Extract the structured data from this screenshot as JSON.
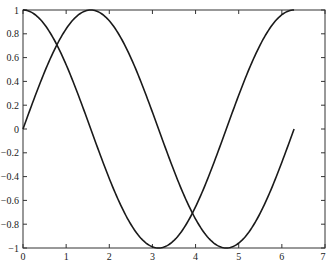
{
  "chart_data": {
    "type": "line",
    "title": "",
    "xlabel": "",
    "ylabel": "",
    "xlim": [
      0,
      7
    ],
    "ylim": [
      -1,
      1
    ],
    "grid": false,
    "legend": null,
    "x_ticks": [
      "0",
      "1",
      "2",
      "3",
      "4",
      "5",
      "6",
      "7"
    ],
    "y_ticks": [
      "-1",
      "-0.8",
      "-0.6",
      "-0.4",
      "-0.2",
      "0",
      "0.2",
      "0.4",
      "0.6",
      "0.8",
      "1"
    ],
    "series": [
      {
        "name": "sin(x)",
        "color": "#1a1a1a",
        "x": [
          0,
          0.5,
          1.0,
          1.5708,
          2.0,
          2.5,
          3.0,
          3.1416,
          3.5,
          4.0,
          4.7124,
          5.0,
          5.5,
          6.0,
          6.2832
        ],
        "y": [
          0,
          0.479,
          0.841,
          1.0,
          0.909,
          0.598,
          0.141,
          0,
          -0.351,
          -0.757,
          -1.0,
          -0.959,
          -0.706,
          -0.279,
          0
        ]
      },
      {
        "name": "cos(x)",
        "color": "#1a1a1a",
        "x": [
          0,
          0.5,
          1.0,
          1.5708,
          2.0,
          2.5,
          3.0,
          3.1416,
          3.5,
          4.0,
          4.7124,
          5.0,
          5.5,
          6.0,
          6.2832
        ],
        "y": [
          1.0,
          0.878,
          0.54,
          0,
          -0.416,
          -0.801,
          -0.99,
          -1.0,
          -0.936,
          -0.654,
          0,
          0.284,
          0.709,
          0.96,
          1.0
        ]
      }
    ],
    "plot_area_px": {
      "left": 23,
      "right": 325,
      "top": 10,
      "bottom": 248
    }
  }
}
